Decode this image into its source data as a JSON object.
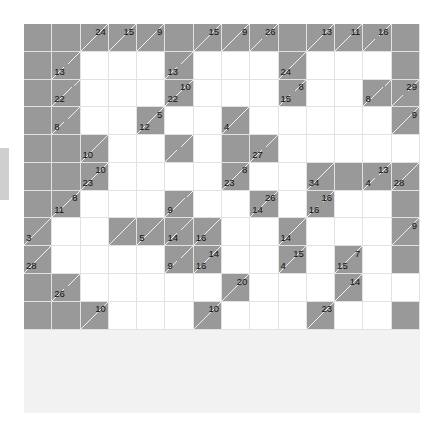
{
  "page": {
    "type": "kakuro",
    "rows": 14,
    "cols": 14,
    "colors": {
      "block": "#999999",
      "open": "#ffffff",
      "grid_line": "#e2e2e2",
      "clue_text": "#111111",
      "page_background": "#ffffff",
      "side_tab": "#cfcfcf"
    }
  },
  "side_tab": {
    "name": "left-edge-tab"
  },
  "grid": {
    "legend": {
      "block": "solid filled cell (no clue)",
      "open": "empty answer cell",
      "split": "clue cell with diagonal; 'down' = upper-right number, 'across' = lower-left number"
    },
    "cells": [
      [
        {
          "t": "block"
        },
        {
          "t": "block"
        },
        {
          "t": "split",
          "down": "24"
        },
        {
          "t": "split",
          "down": "15"
        },
        {
          "t": "split",
          "down": "9"
        },
        {
          "t": "block"
        },
        {
          "t": "split",
          "down": "15"
        },
        {
          "t": "split",
          "down": "9"
        },
        {
          "t": "split",
          "down": "26"
        },
        {
          "t": "block"
        },
        {
          "t": "split",
          "down": "13"
        },
        {
          "t": "split",
          "down": "11"
        },
        {
          "t": "split",
          "down": "16"
        },
        {
          "t": "block"
        }
      ],
      [
        {
          "t": "block"
        },
        {
          "t": "split",
          "across": "13"
        },
        {
          "t": "open"
        },
        {
          "t": "open"
        },
        {
          "t": "open"
        },
        {
          "t": "split",
          "across": "13"
        },
        {
          "t": "open"
        },
        {
          "t": "open"
        },
        {
          "t": "open"
        },
        {
          "t": "split",
          "across": "24"
        },
        {
          "t": "open"
        },
        {
          "t": "open"
        },
        {
          "t": "open"
        },
        {
          "t": "block"
        }
      ],
      [
        {
          "t": "block"
        },
        {
          "t": "split",
          "across": "22"
        },
        {
          "t": "open"
        },
        {
          "t": "open"
        },
        {
          "t": "open"
        },
        {
          "t": "split",
          "across": "22",
          "down2": "10"
        },
        {
          "t": "open"
        },
        {
          "t": "open"
        },
        {
          "t": "open"
        },
        {
          "t": "split",
          "across": "15",
          "down2": "8"
        },
        {
          "t": "open"
        },
        {
          "t": "open"
        },
        {
          "t": "split",
          "across": "8"
        },
        {
          "t": "split",
          "down": "29"
        }
      ],
      [
        {
          "t": "block"
        },
        {
          "t": "split",
          "across": "8"
        },
        {
          "t": "open"
        },
        {
          "t": "open"
        },
        {
          "t": "split",
          "across": "12",
          "down2": "5"
        },
        {
          "t": "open"
        },
        {
          "t": "open"
        },
        {
          "t": "split",
          "across": "4"
        },
        {
          "t": "open"
        },
        {
          "t": "open"
        },
        {
          "t": "open"
        },
        {
          "t": "open"
        },
        {
          "t": "open"
        },
        {
          "t": "split",
          "down": "9"
        }
      ],
      [
        {
          "t": "block"
        },
        {
          "t": "block"
        },
        {
          "t": "split",
          "across": "10"
        },
        {
          "t": "open"
        },
        {
          "t": "open"
        },
        {
          "t": "split",
          "across": "12b"
        },
        {
          "t": "open"
        },
        {
          "t": "block"
        },
        {
          "t": "split",
          "across": "27"
        },
        {
          "t": "open"
        },
        {
          "t": "open"
        },
        {
          "t": "open"
        },
        {
          "t": "open"
        },
        {
          "t": "open"
        }
      ],
      [
        {
          "t": "block"
        },
        {
          "t": "block"
        },
        {
          "t": "split",
          "across": "23",
          "down2": "10"
        },
        {
          "t": "open"
        },
        {
          "t": "open"
        },
        {
          "t": "open"
        },
        {
          "t": "open"
        },
        {
          "t": "split",
          "across": "23",
          "down2": "8"
        },
        {
          "t": "open"
        },
        {
          "t": "open"
        },
        {
          "t": "split",
          "across": "34"
        },
        {
          "t": "block"
        },
        {
          "t": "split",
          "across": "4",
          "down2": "13"
        },
        {
          "t": "split",
          "across": "28"
        }
      ],
      [
        {
          "t": "block"
        },
        {
          "t": "split",
          "across": "11",
          "down2": "8"
        },
        {
          "t": "open"
        },
        {
          "t": "open"
        },
        {
          "t": "open"
        },
        {
          "t": "split",
          "across": "9"
        },
        {
          "t": "open"
        },
        {
          "t": "open"
        },
        {
          "t": "split",
          "across": "14",
          "down2": "26"
        },
        {
          "t": "open"
        },
        {
          "t": "split",
          "across": "16",
          "down2": "16"
        },
        {
          "t": "open"
        },
        {
          "t": "open"
        },
        {
          "t": "block"
        }
      ],
      [
        {
          "t": "split",
          "across": "3"
        },
        {
          "t": "open"
        },
        {
          "t": "open"
        },
        {
          "t": "split"
        },
        {
          "t": "split",
          "across": "5"
        },
        {
          "t": "split",
          "across": "14"
        },
        {
          "t": "split",
          "across": "16"
        },
        {
          "t": "open"
        },
        {
          "t": "open"
        },
        {
          "t": "split",
          "across": "14"
        },
        {
          "t": "open"
        },
        {
          "t": "open"
        },
        {
          "t": "open"
        },
        {
          "t": "split",
          "down": "9"
        }
      ],
      [
        {
          "t": "split",
          "across": "28"
        },
        {
          "t": "open"
        },
        {
          "t": "open"
        },
        {
          "t": "open"
        },
        {
          "t": "open"
        },
        {
          "t": "split",
          "across": "9"
        },
        {
          "t": "split",
          "across": "16",
          "down2": "14"
        },
        {
          "t": "open"
        },
        {
          "t": "open"
        },
        {
          "t": "split",
          "across": "4",
          "down2": "15"
        },
        {
          "t": "open"
        },
        {
          "t": "split",
          "across": "15",
          "down2": "7"
        },
        {
          "t": "open"
        },
        {
          "t": "block"
        }
      ],
      [
        {
          "t": "block"
        },
        {
          "t": "split",
          "across": "26"
        },
        {
          "t": "open"
        },
        {
          "t": "open"
        },
        {
          "t": "open"
        },
        {
          "t": "open"
        },
        {
          "t": "open"
        },
        {
          "t": "split",
          "down": "20"
        },
        {
          "t": "open"
        },
        {
          "t": "open"
        },
        {
          "t": "open"
        },
        {
          "t": "split",
          "down": "14"
        },
        {
          "t": "open"
        },
        {
          "t": "open"
        }
      ],
      [
        {
          "t": "block"
        },
        {
          "t": "block"
        },
        {
          "t": "split",
          "down": "10"
        },
        {
          "t": "open"
        },
        {
          "t": "open"
        },
        {
          "t": "open"
        },
        {
          "t": "split",
          "down": "10"
        },
        {
          "t": "open"
        },
        {
          "t": "open"
        },
        {
          "t": "open"
        },
        {
          "t": "split",
          "down": "23"
        },
        {
          "t": "open"
        },
        {
          "t": "open"
        },
        {
          "t": "block"
        }
      ]
    ]
  },
  "clue_values": {
    "all_down": [
      "24",
      "15",
      "9",
      "15",
      "9",
      "26",
      "13",
      "11",
      "16",
      "29",
      "9",
      "10",
      "8",
      "5",
      "10",
      "8",
      "26",
      "16",
      "14",
      "7",
      "20",
      "14",
      "23",
      "13",
      "10"
    ],
    "all_across": [
      "13",
      "13",
      "24",
      "22",
      "22",
      "15",
      "8",
      "8",
      "12",
      "4",
      "27",
      "10",
      "23",
      "23",
      "34",
      "4",
      "28",
      "11",
      "9",
      "14",
      "16",
      "3",
      "5",
      "14",
      "16",
      "14",
      "28",
      "9",
      "16",
      "4",
      "15",
      "26",
      "15",
      "7",
      "20",
      "14",
      "10",
      "10",
      "23",
      "26"
    ]
  }
}
